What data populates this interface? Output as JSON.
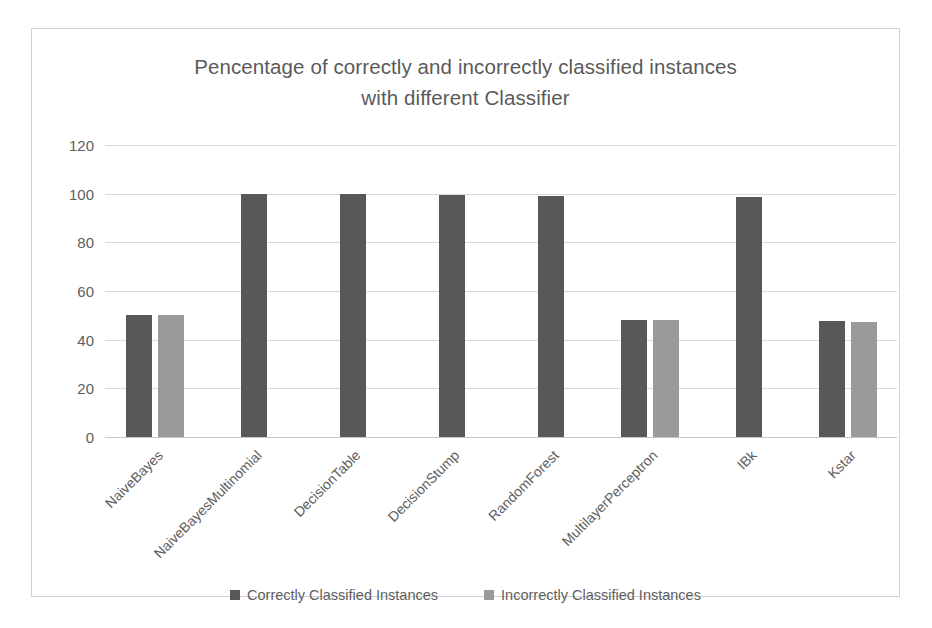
{
  "chart_data": {
    "type": "bar",
    "title": "Pencentage of correctly and incorrectly classified instances with different Classifier",
    "title_line1": "Pencentage of correctly and incorrectly classified instances",
    "title_line2": "with different Classifier",
    "xlabel": "",
    "ylabel": "",
    "ylim": [
      0,
      120
    ],
    "yticks": [
      0,
      20,
      40,
      60,
      80,
      100,
      120
    ],
    "grid": true,
    "legend_position": "bottom",
    "categories": [
      "NaiveBayes",
      "NaiveBayesMultinomial",
      "DecisionTable",
      "DecisionStump",
      "RandomForest",
      "MultilayerPerceptron",
      "IBk",
      "Kstar"
    ],
    "series": [
      {
        "name": "Correctly Classified Instances",
        "color": "#585858",
        "values": [
          50,
          100,
          100,
          99.6,
          99,
          48,
          98.8,
          47.5
        ]
      },
      {
        "name": "Incorrectly Classified Instances",
        "color": "#9a9a9a",
        "values": [
          50,
          0,
          0,
          0,
          0,
          48,
          0,
          47.3
        ]
      }
    ]
  },
  "colors": {
    "series_correct": "#585858",
    "series_incorrect": "#9a9a9a",
    "text": "#5e5e5e",
    "gridline": "#d9d9d9",
    "frame_border": "#d2d2d2",
    "background": "#ffffff"
  }
}
